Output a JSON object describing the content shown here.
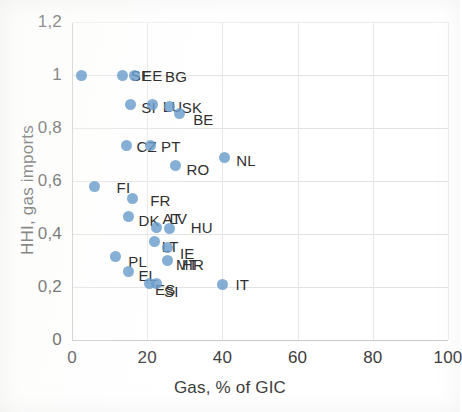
{
  "chart_data": {
    "type": "scatter",
    "title": "",
    "xlabel": "Gas, % of GIC",
    "ylabel": "HHI, gas imports",
    "xlim": [
      0,
      100
    ],
    "ylim": [
      0,
      1.2
    ],
    "xticks": [
      "0",
      "20",
      "40",
      "60",
      "80",
      "100"
    ],
    "yticks": [
      "0",
      "0,2",
      "0,4",
      "0,6",
      "0,8",
      "1",
      "1,2"
    ],
    "xtick_values": [
      0,
      20,
      40,
      60,
      80,
      100
    ],
    "ytick_values": [
      0,
      0.2,
      0.4,
      0.6,
      0.8,
      1,
      1.2
    ],
    "decimal_separator": ",",
    "grid": "both",
    "legend": "none",
    "marker_color": "#6a9ecb",
    "points": [
      {
        "label": "",
        "x": 2.5,
        "y": 1.0,
        "label_dx": 0,
        "label_dy": 0,
        "show_label": false
      },
      {
        "label": "SE",
        "x": 13.5,
        "y": 1.0,
        "label_dx": 8,
        "label_dy": 0
      },
      {
        "label": "EE",
        "x": 16.5,
        "y": 1.0,
        "label_dx": 8,
        "label_dy": 0
      },
      {
        "label": "BG",
        "x": 16.5,
        "y": 1.0,
        "label_dx": 31,
        "label_dy": 1,
        "show_point": false
      },
      {
        "label": "SI",
        "x": 15.5,
        "y": 0.89,
        "label_dx": 11,
        "label_dy": 3
      },
      {
        "label": "LU",
        "x": 21.5,
        "y": 0.89,
        "label_dx": 10,
        "label_dy": 2
      },
      {
        "label": "SK",
        "x": 26.0,
        "y": 0.88,
        "label_dx": 12,
        "label_dy": 0
      },
      {
        "label": "BE",
        "x": 28.5,
        "y": 0.855,
        "label_dx": 14,
        "label_dy": 6
      },
      {
        "label": "CZ",
        "x": 14.5,
        "y": 0.735,
        "label_dx": 10,
        "label_dy": 1
      },
      {
        "label": "PT",
        "x": 21.0,
        "y": 0.735,
        "label_dx": 10,
        "label_dy": 1
      },
      {
        "label": "RO",
        "x": 27.5,
        "y": 0.66,
        "label_dx": 11,
        "label_dy": 4
      },
      {
        "label": "NL",
        "x": 40.5,
        "y": 0.69,
        "label_dx": 12,
        "label_dy": 3
      },
      {
        "label": "FI",
        "x": 6.0,
        "y": 0.58,
        "label_dx": 22,
        "label_dy": 1
      },
      {
        "label": "FR",
        "x": 16.0,
        "y": 0.535,
        "label_dx": 18,
        "label_dy": 2
      },
      {
        "label": "DK",
        "x": 15.0,
        "y": 0.465,
        "label_dx": 10,
        "label_dy": 3
      },
      {
        "label": "AT",
        "x": 22.5,
        "y": 0.425,
        "label_dx": 6,
        "label_dy": -9
      },
      {
        "label": "LV",
        "x": 22.5,
        "y": 0.425,
        "label_dx": 13,
        "label_dy": -9,
        "show_point": false
      },
      {
        "label": "HU",
        "x": 26.0,
        "y": 0.42,
        "label_dx": 21,
        "label_dy": -2
      },
      {
        "label": "LT",
        "x": 22.0,
        "y": 0.37,
        "label_dx": 7,
        "label_dy": 4
      },
      {
        "label": "IE",
        "x": 25.5,
        "y": 0.35,
        "label_dx": 12,
        "label_dy": 6
      },
      {
        "label": "PL",
        "x": 11.5,
        "y": 0.315,
        "label_dx": 13,
        "label_dy": 4
      },
      {
        "label": "MT",
        "x": 25.5,
        "y": 0.3,
        "label_dx": 8,
        "label_dy": 3
      },
      {
        "label": "HR",
        "x": 25.5,
        "y": 0.3,
        "label_dx": 14,
        "label_dy": 3,
        "show_point": false
      },
      {
        "label": "EL",
        "x": 15.0,
        "y": 0.26,
        "label_dx": 10,
        "label_dy": 4
      },
      {
        "label": "ES",
        "x": 20.5,
        "y": 0.215,
        "label_dx": 6,
        "label_dy": 6
      },
      {
        "label": "SI2",
        "x": 20.5,
        "y": 0.215,
        "label_dx": 15,
        "label_dy": 8,
        "show_point": false,
        "text": "SI"
      },
      {
        "label": "",
        "x": 22.5,
        "y": 0.215,
        "show_label": false
      },
      {
        "label": "IT",
        "x": 40.0,
        "y": 0.21,
        "label_dx": 13,
        "label_dy": 0
      }
    ]
  }
}
